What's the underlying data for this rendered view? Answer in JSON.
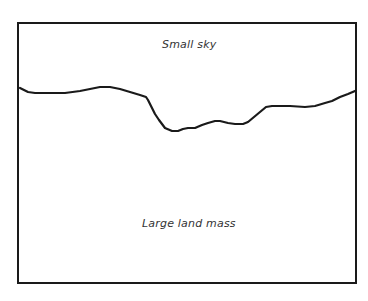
{
  "diagram": {
    "type": "sketch",
    "regions": {
      "sky": {
        "label": "Small sky"
      },
      "land": {
        "label": "Large land mass"
      }
    },
    "colors": {
      "stroke": "#1a1a1a",
      "text": "#333333",
      "background": "#ffffff"
    },
    "horizon_points": "20,88 28,92 35,93 50,93 65,93 80,91 100,87 110,87 120,89 130,92 140,95 146,97 148,100 151,106 155,114 159,120 165,128 172,131 178,131 183,129 188,128 195,128 202,125 208,123 215,121 220,121 228,123 235,124 243,124 248,122 254,117 260,112 266,107 272,106 290,106 305,107 315,106 325,103 332,101 340,97 348,94 355,91"
  }
}
